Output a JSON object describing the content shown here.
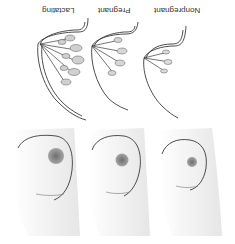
{
  "figure": {
    "orientation": "rotated 180 degrees",
    "labels": {
      "lactating": "Lactating",
      "pregnant": "Pregnant",
      "nonpregnant": "Nonpregnant"
    },
    "panels": [
      {
        "stage": "Lactating",
        "view": "cross-section"
      },
      {
        "stage": "Pregnant",
        "view": "cross-section"
      },
      {
        "stage": "Nonpregnant",
        "view": "cross-section"
      },
      {
        "stage": "Lactating",
        "view": "external"
      },
      {
        "stage": "Pregnant",
        "view": "external"
      },
      {
        "stage": "Nonpregnant",
        "view": "external"
      }
    ],
    "colors": {
      "line": "#3a3a3a",
      "shade": "#cfcfcf",
      "areola": "#8a8a8a",
      "background": "#ffffff"
    }
  }
}
